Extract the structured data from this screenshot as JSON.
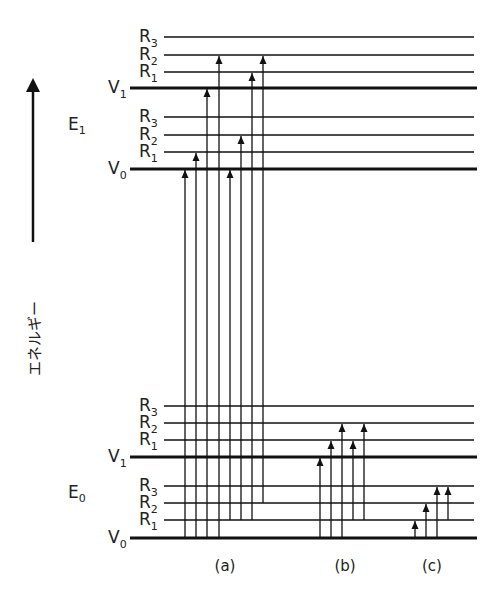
{
  "axis": {
    "label": "エネルギー",
    "direction": "up"
  },
  "states": [
    {
      "name": "E",
      "sub": "1",
      "label_y": 130,
      "levels": [
        {
          "key": "V0",
          "name": "V",
          "sub": "0",
          "y": 169,
          "type": "vibrational"
        },
        {
          "key": "R1",
          "name": "R",
          "sub": "1",
          "y": 152,
          "type": "rotational"
        },
        {
          "key": "R2",
          "name": "R",
          "sub": "2",
          "y": 135,
          "type": "rotational"
        },
        {
          "key": "R3",
          "name": "R",
          "sub": "3",
          "y": 117,
          "type": "rotational"
        },
        {
          "key": "V1",
          "name": "V",
          "sub": "1",
          "y": 88,
          "type": "vibrational"
        },
        {
          "key": "R1",
          "name": "R",
          "sub": "1",
          "y": 72,
          "type": "rotational"
        },
        {
          "key": "R2",
          "name": "R",
          "sub": "2",
          "y": 55,
          "type": "rotational"
        },
        {
          "key": "R3",
          "name": "R",
          "sub": "3",
          "y": 37,
          "type": "rotational"
        }
      ]
    },
    {
      "name": "E",
      "sub": "0",
      "label_y": 498,
      "levels": [
        {
          "key": "V0",
          "name": "V",
          "sub": "0",
          "y": 538,
          "type": "vibrational"
        },
        {
          "key": "R1",
          "name": "R",
          "sub": "1",
          "y": 520,
          "type": "rotational"
        },
        {
          "key": "R2",
          "name": "R",
          "sub": "2",
          "y": 503,
          "type": "rotational"
        },
        {
          "key": "R3",
          "name": "R",
          "sub": "3",
          "y": 486,
          "type": "rotational"
        },
        {
          "key": "V1",
          "name": "V",
          "sub": "1",
          "y": 457,
          "type": "vibrational"
        },
        {
          "key": "R1",
          "name": "R",
          "sub": "1",
          "y": 440,
          "type": "rotational"
        },
        {
          "key": "R2",
          "name": "R",
          "sub": "2",
          "y": 423,
          "type": "rotational"
        },
        {
          "key": "R3",
          "name": "R",
          "sub": "3",
          "y": 406,
          "type": "rotational"
        }
      ]
    }
  ],
  "groups": [
    {
      "label": "(a)",
      "label_x": 225,
      "transitions": [
        {
          "x": 185,
          "from": "E0.V0",
          "to": "E1.V0",
          "y1": 538,
          "y2": 169
        },
        {
          "x": 196,
          "from": "E0.V0",
          "to": "E1.R1",
          "y1": 538,
          "y2": 152
        },
        {
          "x": 207,
          "from": "E0.V0",
          "to": "E1.V1",
          "y1": 538,
          "y2": 88
        },
        {
          "x": 219,
          "from": "E0.V0",
          "to": "E1.R2(V1)",
          "y1": 538,
          "y2": 55
        },
        {
          "x": 230,
          "from": "E0.R1",
          "to": "E1.V0",
          "y1": 520,
          "y2": 169
        },
        {
          "x": 241,
          "from": "E0.R1",
          "to": "E1.R2",
          "y1": 520,
          "y2": 135
        },
        {
          "x": 252,
          "from": "E0.R1",
          "to": "E1.R1(V1)",
          "y1": 520,
          "y2": 72
        },
        {
          "x": 263,
          "from": "E0.R2",
          "to": "E1.R2(V1)",
          "y1": 503,
          "y2": 55
        }
      ]
    },
    {
      "label": "(b)",
      "label_x": 345,
      "transitions": [
        {
          "x": 320,
          "from": "V0",
          "to": "V1",
          "y1": 538,
          "y2": 457
        },
        {
          "x": 331,
          "from": "V0",
          "to": "R1(V1)",
          "y1": 538,
          "y2": 440
        },
        {
          "x": 342,
          "from": "V0",
          "to": "R2(V1)",
          "y1": 538,
          "y2": 423
        },
        {
          "x": 353,
          "from": "R1",
          "to": "R1(V1)",
          "y1": 520,
          "y2": 440
        },
        {
          "x": 364,
          "from": "R1",
          "to": "R2(V1)",
          "y1": 520,
          "y2": 423
        }
      ]
    },
    {
      "label": "(c)",
      "label_x": 432,
      "transitions": [
        {
          "x": 415,
          "from": "V0",
          "to": "R1",
          "y1": 538,
          "y2": 520
        },
        {
          "x": 426,
          "from": "V0",
          "to": "R2",
          "y1": 538,
          "y2": 503
        },
        {
          "x": 437,
          "from": "V0",
          "to": "R3",
          "y1": 538,
          "y2": 486
        },
        {
          "x": 448,
          "from": "R1",
          "to": "R3",
          "y1": 520,
          "y2": 486
        }
      ]
    }
  ],
  "colors": {
    "ink": "#111111",
    "background": "#ffffff"
  }
}
